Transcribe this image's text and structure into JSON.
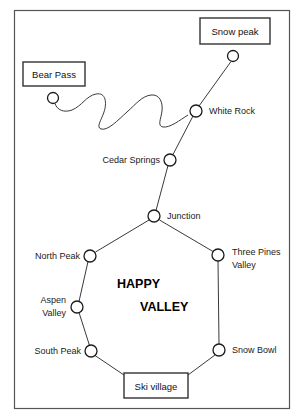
{
  "diagram": {
    "title_lines": [
      "HAPPY",
      "VALLEY"
    ],
    "frame": {
      "x": 14,
      "y": 10,
      "width": 276,
      "height": 399
    },
    "colors": {
      "background": "#ffffff",
      "frame_stroke": "#555555",
      "line_stroke": "#3a3a3a",
      "node_stroke": "#1a1a1a",
      "node_fill": "#ffffff",
      "box_stroke": "#333333",
      "text": "#1a1a1a"
    },
    "terminus_boxes": [
      {
        "id": "snow-peak",
        "label": "Snow peak",
        "x": 200,
        "y": 18,
        "width": 70,
        "height": 26
      },
      {
        "id": "bear-pass",
        "label": "Bear Pass",
        "x": 23,
        "y": 62,
        "width": 62,
        "height": 24
      },
      {
        "id": "ski-village",
        "label": "Ski village",
        "x": 124,
        "y": 373,
        "width": 64,
        "height": 25
      }
    ],
    "nodes": [
      {
        "id": "snow-peak-node",
        "label": "",
        "cx": 233,
        "cy": 56,
        "r": 5.5,
        "label_anchor": "none"
      },
      {
        "id": "bear-pass-node",
        "label": "",
        "cx": 53,
        "cy": 98,
        "r": 5.5,
        "label_anchor": "none"
      },
      {
        "id": "white-rock",
        "label": "White Rock",
        "cx": 196,
        "cy": 111,
        "r": 6,
        "label_anchor": "start",
        "label_x": 209,
        "label_y": 114
      },
      {
        "id": "cedar-springs",
        "label": "Cedar Springs",
        "cx": 170,
        "cy": 160,
        "r": 6,
        "label_anchor": "end",
        "label_x": 160,
        "label_y": 163
      },
      {
        "id": "junction",
        "label": "Junction",
        "cx": 154,
        "cy": 216,
        "r": 6,
        "label_anchor": "start",
        "label_x": 167,
        "label_y": 219
      },
      {
        "id": "north-peak",
        "label": "North Peak",
        "cx": 90,
        "cy": 256,
        "r": 6,
        "label_anchor": "end",
        "label_x": 80,
        "label_y": 259
      },
      {
        "id": "three-pines-valley",
        "label": "Three Pines Valley",
        "cx": 218,
        "cy": 255,
        "r": 6,
        "label_anchor": "start-2line",
        "label_x": 232,
        "label_y": 253,
        "line1": "Three Pines",
        "line2": "Valley"
      },
      {
        "id": "aspen-valley",
        "label": "Aspen Valley",
        "cx": 77,
        "cy": 307,
        "r": 6,
        "label_anchor": "end-2line",
        "label_x": 66,
        "label_y": 304,
        "line1": "Aspen",
        "line2": "Valley"
      },
      {
        "id": "south-peak",
        "label": "South Peak",
        "cx": 91,
        "cy": 351,
        "r": 6,
        "label_anchor": "end",
        "label_x": 81,
        "label_y": 354
      },
      {
        "id": "snow-bowl",
        "label": "Snow Bowl",
        "cx": 219,
        "cy": 350,
        "r": 6,
        "label_anchor": "start",
        "label_x": 232,
        "label_y": 353
      }
    ],
    "edges": [
      {
        "id": "edge-snow-peak-white-rock",
        "from": "snow-peak-node",
        "to": "white-rock",
        "type": "straight"
      },
      {
        "id": "edge-bear-pass-white-rock",
        "from": "bear-pass-node",
        "to": "white-rock",
        "type": "wavy"
      },
      {
        "id": "edge-white-rock-cedar-springs",
        "from": "white-rock",
        "to": "cedar-springs",
        "type": "straight"
      },
      {
        "id": "edge-cedar-springs-junction",
        "from": "cedar-springs",
        "to": "junction",
        "type": "straight"
      },
      {
        "id": "edge-junction-north-peak",
        "from": "junction",
        "to": "north-peak",
        "type": "straight"
      },
      {
        "id": "edge-junction-three-pines",
        "from": "junction",
        "to": "three-pines-valley",
        "type": "straight"
      },
      {
        "id": "edge-north-peak-aspen-valley",
        "from": "north-peak",
        "to": "aspen-valley",
        "type": "straight"
      },
      {
        "id": "edge-aspen-valley-south-peak",
        "from": "aspen-valley",
        "to": "south-peak",
        "type": "straight"
      },
      {
        "id": "edge-south-peak-ski-village",
        "from": "south-peak",
        "to": "ski-village",
        "type": "straight"
      },
      {
        "id": "edge-ski-village-snow-bowl",
        "from": "ski-village",
        "to": "snow-bowl",
        "type": "straight"
      },
      {
        "id": "edge-snow-bowl-three-pines",
        "from": "snow-bowl",
        "to": "three-pines-valley",
        "type": "straight"
      }
    ],
    "region_title": {
      "line1_x": 117,
      "line1_y": 288,
      "line2_x": 140,
      "line2_y": 311
    }
  }
}
